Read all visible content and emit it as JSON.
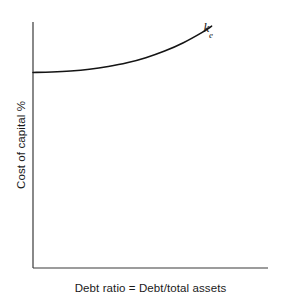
{
  "figure": {
    "axes": {
      "x_axis_name": "x-axis-line",
      "y_axis_name": "y-axis-line"
    }
  },
  "chart_data": {
    "type": "line",
    "title": "",
    "subtitle": "",
    "xlabel": "Debt ratio = Debt/total assets",
    "ylabel": "Cost of capital %",
    "grid": false,
    "legend": false,
    "legend_position": "none",
    "xlim": [
      0,
      1
    ],
    "ylim": [
      0,
      1
    ],
    "x_tick_labels": [],
    "y_tick_labels": [],
    "annotations": [
      {
        "name": "cost-of-equity-label",
        "symbol": "k",
        "subscript": "e",
        "text": "ke",
        "x": 0.76,
        "y": 0.93
      }
    ],
    "series": [
      {
        "name": "ke",
        "label": "Cost of equity",
        "color": "#141414",
        "linewidth": 1.6,
        "x": [
          0.0,
          0.08,
          0.16,
          0.24,
          0.32,
          0.4,
          0.48,
          0.56,
          0.64,
          0.72,
          0.76
        ],
        "y": [
          0.795,
          0.797,
          0.801,
          0.808,
          0.819,
          0.834,
          0.855,
          0.882,
          0.916,
          0.958,
          0.983
        ]
      }
    ]
  },
  "labels": {
    "y_axis_title": "Cost of capital %",
    "x_axis_title": "Debt ratio = Debt/total assets",
    "curve_symbol": "k",
    "curve_subscript": "e"
  },
  "colors": {
    "background": "#ffffff",
    "axis": "#3a3a3a",
    "curve": "#141414",
    "text": "#1a1a1a"
  }
}
